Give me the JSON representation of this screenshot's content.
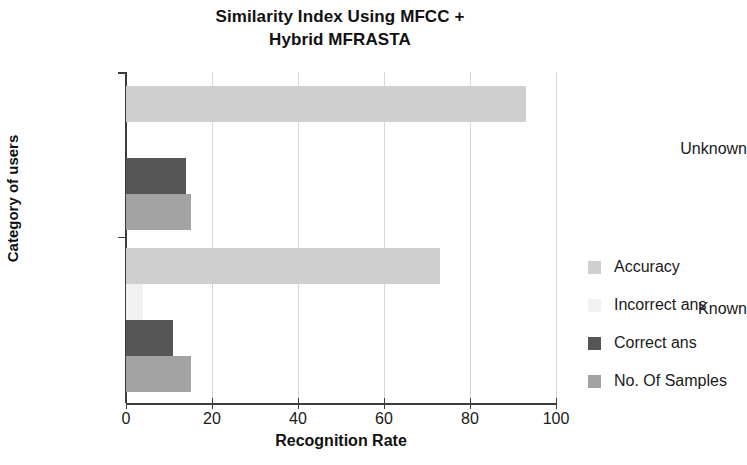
{
  "chart_data": {
    "type": "bar",
    "orientation": "horizontal",
    "title": "Similarity Index Using MFCC + Hybrid MFRASTA",
    "title_lines": [
      "Similarity Index Using MFCC +",
      "Hybrid MFRASTA"
    ],
    "xlabel": "Recognition Rate",
    "ylabel": "Category of users",
    "categories": [
      "Known",
      "Unknown"
    ],
    "xlim": [
      0,
      100
    ],
    "xticks": [
      0,
      20,
      40,
      60,
      80,
      100
    ],
    "xticklabels": [
      "0",
      "20",
      "40",
      "60",
      "80",
      "100"
    ],
    "grid": "vertical",
    "legend_position": "right",
    "series": [
      {
        "name": "Accuracy",
        "color": "#cfcfcf",
        "values": [
          73,
          93
        ]
      },
      {
        "name": "Incorrect ans",
        "color": "#f1f1f1",
        "values": [
          4,
          0
        ]
      },
      {
        "name": "Correct ans",
        "color": "#565656",
        "values": [
          11,
          14
        ]
      },
      {
        "name": "No. Of Samples",
        "color": "#a3a3a3",
        "values": [
          15,
          15
        ]
      }
    ]
  },
  "legend": {
    "items": [
      {
        "label": "Accuracy"
      },
      {
        "label": "Incorrect ans"
      },
      {
        "label": "Correct ans"
      },
      {
        "label": "No. Of Samples"
      }
    ]
  },
  "axes": {
    "x_title": "Recognition Rate",
    "y_title": "Category of users",
    "y_categories": [
      "Unknown",
      "Known"
    ]
  }
}
